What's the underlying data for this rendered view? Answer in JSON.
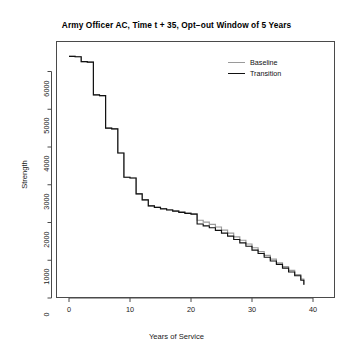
{
  "chart_data": {
    "type": "line",
    "title": "Army Officer AC, Time t + 35, Opt−out Window of 5 Years",
    "xlabel": "Years of Service",
    "ylabel": "Strength",
    "xlim": [
      0,
      40
    ],
    "ylim": [
      0,
      6450
    ],
    "xticks": [
      0,
      10,
      20,
      30,
      40
    ],
    "yticks": [
      0,
      1000,
      2000,
      3000,
      4000,
      5000,
      6000
    ],
    "grid": false,
    "legend_position": "top-right-inside",
    "step_style": "hv",
    "series": [
      {
        "name": "Baseline",
        "color": "#9a9a9a",
        "x": [
          0,
          1,
          2,
          3,
          4,
          5,
          6,
          7,
          8,
          9,
          10,
          11,
          12,
          13,
          14,
          15,
          16,
          17,
          18,
          19,
          20,
          21,
          22,
          23,
          24,
          25,
          26,
          27,
          28,
          29,
          30,
          31,
          32,
          33,
          34,
          35,
          36,
          37,
          38,
          38.5
        ],
        "values": [
          6400,
          6390,
          6260,
          6250,
          5380,
          5360,
          4500,
          4480,
          3840,
          3200,
          3180,
          2760,
          2600,
          2440,
          2400,
          2370,
          2340,
          2310,
          2280,
          2250,
          2230,
          2060,
          2010,
          1950,
          1880,
          1800,
          1720,
          1620,
          1530,
          1430,
          1330,
          1230,
          1130,
          1030,
          930,
          830,
          730,
          620,
          500,
          350
        ]
      },
      {
        "name": "Transition",
        "color": "#111111",
        "x": [
          0,
          1,
          2,
          3,
          4,
          5,
          6,
          7,
          8,
          9,
          10,
          11,
          12,
          13,
          14,
          15,
          16,
          17,
          18,
          19,
          20,
          21,
          22,
          23,
          24,
          25,
          26,
          27,
          28,
          29,
          30,
          31,
          32,
          33,
          34,
          35,
          36,
          37,
          38,
          38.5
        ],
        "values": [
          6400,
          6390,
          6260,
          6250,
          5380,
          5360,
          4500,
          4480,
          3840,
          3200,
          3180,
          2760,
          2600,
          2440,
          2400,
          2360,
          2330,
          2300,
          2270,
          2240,
          2220,
          1960,
          1910,
          1860,
          1790,
          1720,
          1640,
          1550,
          1460,
          1370,
          1270,
          1180,
          1080,
          980,
          890,
          790,
          690,
          590,
          470,
          350
        ]
      }
    ]
  },
  "legend": {
    "items": [
      {
        "label": "Baseline",
        "color": "#9a9a9a"
      },
      {
        "label": "Transition",
        "color": "#111111"
      }
    ]
  }
}
